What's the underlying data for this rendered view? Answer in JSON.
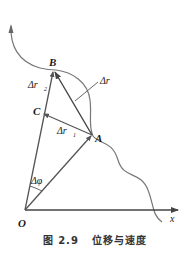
{
  "figure": {
    "labels": {
      "origin": "O",
      "point_a": "A",
      "point_b": "B",
      "point_c": "C",
      "axis_x": "x",
      "delta_r": "Δr⃗",
      "delta_r1": "Δr⃗",
      "delta_r1_sub": "1",
      "delta_r2": "Δr⃗",
      "delta_r2_sub": "2",
      "delta_phi": "Δφ"
    },
    "colors": {
      "line": "#555555",
      "curve": "#777777",
      "text": "#1a1a1a"
    }
  },
  "caption": {
    "number": "图 2.9",
    "title": "位移与速度"
  }
}
